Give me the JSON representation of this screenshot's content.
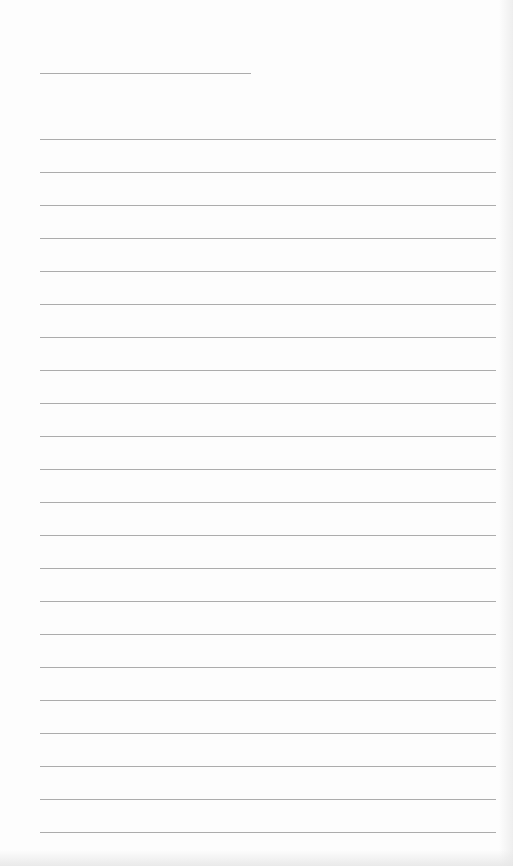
{
  "page": {
    "type": "lined-notebook-page",
    "background_color": "#fdfdfd",
    "line_color": "#acacac",
    "title_line": {
      "text": ""
    },
    "ruled_lines": {
      "count": 22,
      "spacing_px": 33,
      "entries": [
        "",
        "",
        "",
        "",
        "",
        "",
        "",
        "",
        "",
        "",
        "",
        "",
        "",
        "",
        "",
        "",
        "",
        "",
        "",
        "",
        "",
        ""
      ]
    }
  }
}
